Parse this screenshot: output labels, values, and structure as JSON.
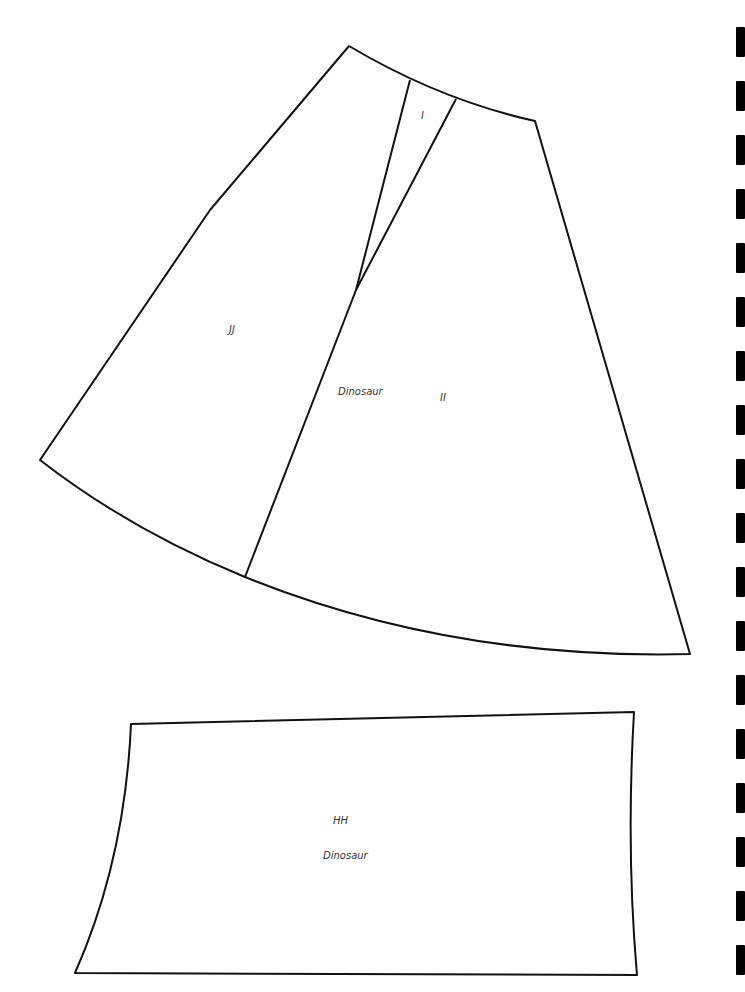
{
  "pattern": {
    "pieces": [
      {
        "id": "I",
        "label": "I"
      },
      {
        "id": "JJ",
        "label": "JJ"
      },
      {
        "id": "II",
        "label": "II",
        "name": "Dinosaur"
      },
      {
        "id": "HH",
        "label": "HH",
        "name": "Dinosaur"
      }
    ]
  },
  "registration_marks": {
    "count": 18,
    "color": "#000000"
  }
}
